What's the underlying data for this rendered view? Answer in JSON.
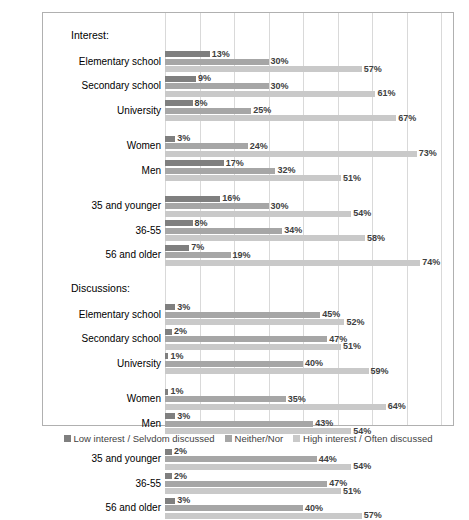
{
  "chart_data": {
    "type": "bar",
    "orientation": "horizontal",
    "title": "",
    "xlabel": "",
    "ylabel": "",
    "xlim": [
      0,
      80
    ],
    "grid": true,
    "legend_position": "bottom",
    "sections": [
      {
        "title": "Interest:",
        "groups": [
          {
            "categories": [
              "Elementary school",
              "Secondary school",
              "University"
            ],
            "values": [
              {
                "low": 13,
                "neither": 30,
                "high": 57
              },
              {
                "low": 9,
                "neither": 30,
                "high": 61
              },
              {
                "low": 8,
                "neither": 25,
                "high": 67
              }
            ]
          },
          {
            "categories": [
              "Women",
              "Men"
            ],
            "values": [
              {
                "low": 3,
                "neither": 24,
                "high": 73
              },
              {
                "low": 17,
                "neither": 32,
                "high": 51
              }
            ]
          },
          {
            "categories": [
              "35 and younger",
              "36-55",
              "56 and older"
            ],
            "values": [
              {
                "low": 16,
                "neither": 30,
                "high": 54
              },
              {
                "low": 8,
                "neither": 34,
                "high": 58
              },
              {
                "low": 7,
                "neither": 19,
                "high": 74
              }
            ]
          }
        ]
      },
      {
        "title": "Discussions:",
        "groups": [
          {
            "categories": [
              "Elementary school",
              "Secondary school",
              "University"
            ],
            "values": [
              {
                "low": 3,
                "neither": 45,
                "high": 52
              },
              {
                "low": 2,
                "neither": 47,
                "high": 51
              },
              {
                "low": 1,
                "neither": 40,
                "high": 59
              }
            ]
          },
          {
            "categories": [
              "Women",
              "Men"
            ],
            "values": [
              {
                "low": 1,
                "neither": 35,
                "high": 64
              },
              {
                "low": 3,
                "neither": 43,
                "high": 54
              }
            ]
          },
          {
            "categories": [
              "35 and younger",
              "36-55",
              "56 and older"
            ],
            "values": [
              {
                "low": 2,
                "neither": 44,
                "high": 54
              },
              {
                "low": 2,
                "neither": 47,
                "high": 51
              },
              {
                "low": 3,
                "neither": 40,
                "high": 57
              }
            ]
          }
        ]
      }
    ],
    "series": [
      {
        "name": "Low interest / Selvdom discussed",
        "key": "low",
        "color": "#7f7f7f"
      },
      {
        "name": "Neither/Nor",
        "key": "neither",
        "color": "#a6a6a6"
      },
      {
        "name": "High interest / Often discussed",
        "key": "high",
        "color": "#c9c9c9"
      }
    ],
    "value_suffix": "%"
  },
  "legend": {
    "items": [
      {
        "label": "Low interest / Selvdom discussed",
        "color": "#7f7f7f"
      },
      {
        "label": "Neither/Nor",
        "color": "#a6a6a6"
      },
      {
        "label": "High interest / Often discussed",
        "color": "#c9c9c9"
      }
    ]
  }
}
